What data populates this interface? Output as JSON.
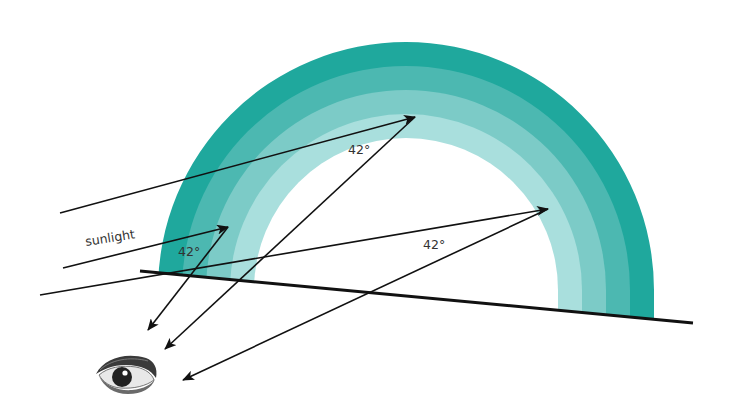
{
  "diagram": {
    "labels": {
      "sunlight": "sunlight",
      "angle_left": "42°",
      "angle_top": "42°",
      "angle_right": "42°"
    },
    "colors": {
      "band_outer": "#1fa89d",
      "band_2": "#4cb8b1",
      "band_3": "#7ccbc7",
      "band_inner": "#a9dfdd",
      "ray": "#111111",
      "ground": "#111111"
    },
    "rainbow": {
      "center_x": 406,
      "base_y": 290,
      "outer_rx": 248,
      "outer_ry": 248,
      "band_width": 24,
      "band_count": 4
    },
    "rays": [
      {
        "name": "ray-top",
        "in_from": [
          60,
          213
        ],
        "hit": [
          415,
          117
        ],
        "out_to": [
          165,
          349
        ]
      },
      {
        "name": "ray-left",
        "in_from": [
          63,
          268
        ],
        "hit": [
          228,
          227
        ],
        "out_to": [
          148,
          330
        ]
      },
      {
        "name": "ray-right",
        "in_from": [
          40,
          295
        ],
        "hit": [
          548,
          209
        ],
        "out_to": [
          183,
          380
        ]
      }
    ],
    "ground_line": {
      "from": [
        140,
        271
      ],
      "to": [
        693,
        323
      ]
    },
    "observer": "eye-icon"
  }
}
